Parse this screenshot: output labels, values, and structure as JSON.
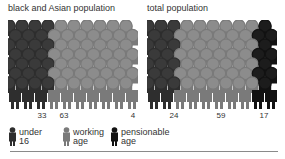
{
  "colors": {
    "under16": "#2e2e2e",
    "under16_head": "#3a3a3a",
    "working": "#7a7a7a",
    "working_head": "#8c8c8c",
    "pensionable": "#121212",
    "pensionable_head": "#1c1c1c",
    "rule": "#8a8a8a"
  },
  "panels": [
    {
      "title": "black and Asian population",
      "labels": [
        "33",
        "63",
        "4"
      ]
    },
    {
      "title": "total population",
      "labels": [
        "24",
        "59",
        "17"
      ]
    }
  ],
  "legend": [
    {
      "label": "under\n16",
      "icon": "person-icon-dark"
    },
    {
      "label": "working\nage",
      "icon": "person-icon-gray"
    },
    {
      "label": "pensionable\nage",
      "icon": "person-icon-black"
    }
  ],
  "chart_data": [
    {
      "type": "bar",
      "title": "black and Asian population",
      "categories": [
        "under 16",
        "working age",
        "pensionable age"
      ],
      "values": [
        33,
        63,
        4
      ],
      "ylabel": "% of population",
      "legend_position": "bottom"
    },
    {
      "type": "bar",
      "title": "total population",
      "categories": [
        "under 16",
        "working age",
        "pensionable age"
      ],
      "values": [
        24,
        59,
        17
      ],
      "ylabel": "% of population",
      "legend_position": "bottom"
    }
  ]
}
